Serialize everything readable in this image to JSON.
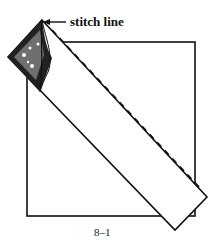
{
  "figure": {
    "annotation": "stitch line",
    "caption": "8–1"
  }
}
